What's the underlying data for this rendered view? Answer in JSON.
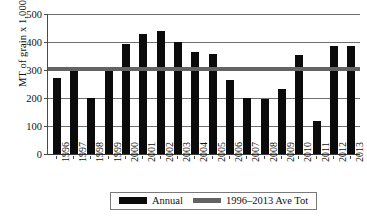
{
  "chart_data": {
    "type": "bar",
    "title": "",
    "xlabel": "",
    "ylabel": "MT of grain x 1,000",
    "ylim": [
      0,
      500
    ],
    "yticks": [
      0,
      100,
      200,
      300,
      400,
      500
    ],
    "ytick_labels": [
      "0",
      "100",
      "200",
      "300",
      "400",
      "500"
    ],
    "grid": true,
    "legend_position": "bottom",
    "categories": [
      "1996",
      "1997",
      "1998",
      "1999",
      "2000",
      "2001",
      "2002",
      "2003",
      "2004",
      "2005",
      "2006",
      "2007",
      "2008",
      "2009",
      "2010",
      "2011",
      "2012",
      "2013"
    ],
    "series": [
      {
        "name": "Annual",
        "type": "bar",
        "color": "#0b0b0b",
        "values": [
          271,
          302,
          199,
          302,
          393,
          429,
          439,
          400,
          364,
          357,
          265,
          200,
          196,
          232,
          354,
          118,
          385,
          385
        ]
      },
      {
        "name": "1996–2013 Ave Tot",
        "type": "line",
        "color": "#636363",
        "value": 305
      }
    ]
  },
  "legend": {
    "items": [
      {
        "label": "Annual",
        "swatch": "annual-swatch"
      },
      {
        "label": "1996–2013 Ave Tot",
        "swatch": "average-swatch"
      }
    ]
  },
  "axes": {
    "y_title": "MT of grain x 1,000"
  }
}
